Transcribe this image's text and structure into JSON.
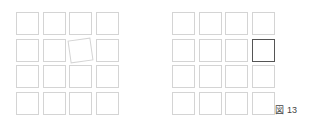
{
  "figure": {
    "caption": "図 13",
    "left_grid": {
      "rows": 4,
      "cols": 4,
      "origin": [
        16,
        12
      ],
      "pitch": 26.5,
      "rotated_cell": {
        "row": 1,
        "col": 2,
        "angle_deg": -8
      }
    },
    "right_grid": {
      "rows": 4,
      "cols": 4,
      "origin": [
        172,
        12
      ],
      "pitch": 26.5,
      "highlighted_cell": {
        "row": 1,
        "col": 3
      }
    },
    "colors": {
      "cell_border": "#d4d4d4",
      "highlight_border": "#555555"
    }
  }
}
